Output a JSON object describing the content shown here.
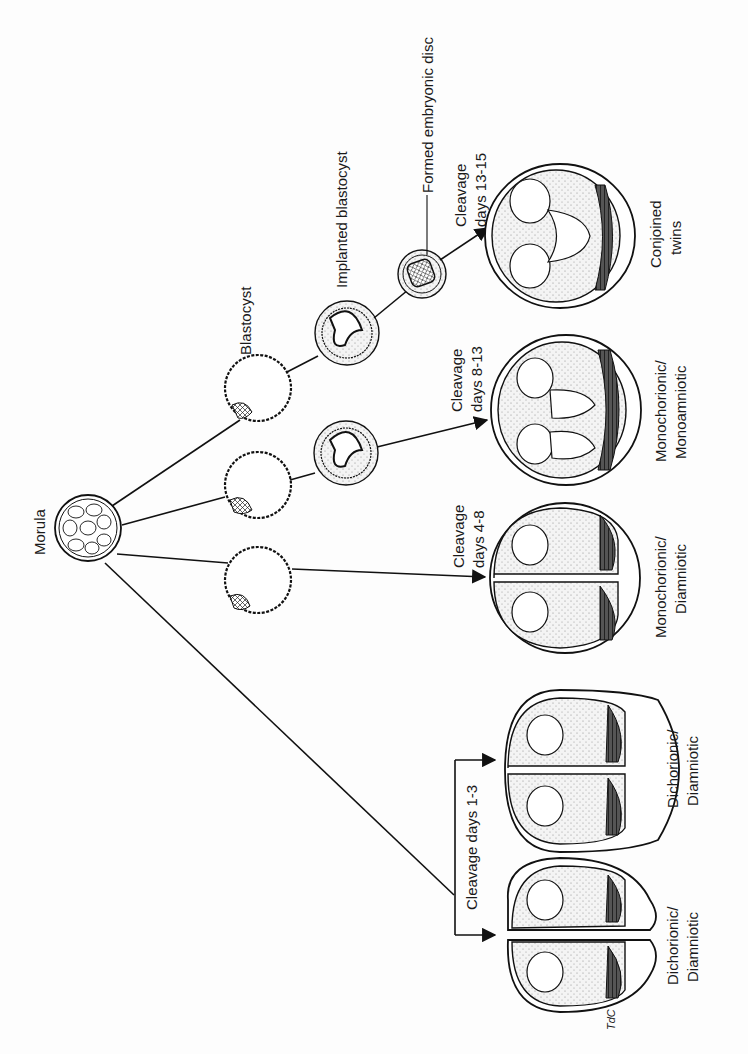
{
  "diagram": {
    "orientation": "rotated-90-ccw",
    "stages": {
      "morula": "Morula",
      "blastocyst": "Blastocyst",
      "implanted_blastocyst": "Implanted blastocyst",
      "formed_embryonic_disc": "Formed embryonic disc"
    },
    "branches": [
      {
        "cleavage_label": "Cleavage days 1-3",
        "outcomes": [
          {
            "label_line1": "Dichorionic/",
            "label_line2": "Diamniotic"
          },
          {
            "label_line1": "Dichorionic/",
            "label_line2": "Diamniotic"
          }
        ]
      },
      {
        "cleavage_line1": "Cleavage",
        "cleavage_line2": "days 4-8",
        "outcome": {
          "label_line1": "Monochorionic/",
          "label_line2": "Diamniotic"
        }
      },
      {
        "cleavage_line1": "Cleavage",
        "cleavage_line2": "days 8-13",
        "outcome": {
          "label_line1": "Monochorionic/",
          "label_line2": "Monoamniotic"
        }
      },
      {
        "cleavage_line1": "Cleavage",
        "cleavage_line2": "days 13-15",
        "outcome": {
          "label_line1": "Conjoined",
          "label_line2": "twins"
        }
      }
    ],
    "signature": "TdC"
  }
}
